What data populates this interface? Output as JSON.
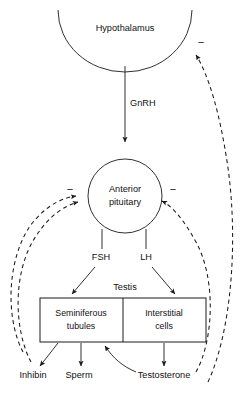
{
  "diagram": {
    "type": "flow-diagram",
    "colors": {
      "stroke": "#1a1a1a",
      "text": "#111111",
      "background": "#ffffff"
    },
    "nodes": {
      "hypothalamus": {
        "label": "Hypothalamus",
        "shape": "arc-capsule",
        "cx": 125,
        "cy": 28
      },
      "anterior_pituitary": {
        "label_line1": "Anterior",
        "label_line2": "pituitary",
        "shape": "circle",
        "cx": 125,
        "cy": 196,
        "r": 37
      },
      "testis": {
        "label": "Testis",
        "shape": "box-group",
        "x": 40,
        "y": 298,
        "width": 166,
        "height": 44
      },
      "seminiferous_tubules": {
        "label_line1": "Seminiferous",
        "label_line2": "tubules",
        "shape": "box",
        "cx": 81,
        "cy": 320
      },
      "interstitial_cells": {
        "label_line1": "Interstitial",
        "label_line2": "cells",
        "shape": "box",
        "cx": 164,
        "cy": 320
      }
    },
    "hormone_labels": {
      "gnrh": "GnRH",
      "fsh": "FSH",
      "lh": "LH"
    },
    "output_labels": {
      "inhibin": "Inhibin",
      "sperm": "Sperm",
      "testosterone": "Testosterone"
    },
    "feedback": {
      "sign": "−",
      "signs_count": 4,
      "descriptions": [
        "Inhibin negative feedback to anterior pituitary",
        "Testosterone negative feedback to anterior pituitary",
        "Testosterone negative feedback to hypothalamus",
        "Inhibin/testosterone negative feedback (left pathway) to anterior pituitary"
      ]
    },
    "arrows": {
      "hypothalamus_to_pituitary": "GnRH",
      "pituitary_to_tubules": "FSH",
      "pituitary_to_interstitial": "LH",
      "tubules_to_inhibin": "Inhibin",
      "tubules_to_sperm": "Sperm",
      "interstitial_to_testosterone": "Testosterone",
      "testosterone_to_tubules": "local action"
    }
  }
}
